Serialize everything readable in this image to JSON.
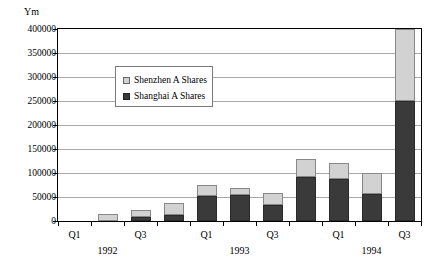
{
  "chart_data": {
    "type": "bar",
    "stacked": true,
    "title": "",
    "subtitle": "",
    "xlabel": "",
    "ylabel": "Ym",
    "ylim": [
      0,
      400000
    ],
    "ystep": 50000,
    "grid": true,
    "legend_position": "inside-top-left",
    "ytick_labels": [
      "400000",
      "350000",
      "300000",
      "250000",
      "200000",
      "150000",
      "100000",
      "50000",
      "0"
    ],
    "ytick_values": [
      400000,
      350000,
      300000,
      250000,
      200000,
      150000,
      100000,
      50000,
      0
    ],
    "categories": [
      "Q1 1992",
      "Q2 1992",
      "Q3 1992",
      "Q4 1992",
      "Q1 1993",
      "Q2 1993",
      "Q3 1993",
      "Q4 1993",
      "Q1 1994",
      "Q2 1994",
      "Q3 1994"
    ],
    "xtick_labels": [
      {
        "label": "Q1",
        "index": 0
      },
      {
        "label": "Q3",
        "index": 2
      },
      {
        "label": "Q1",
        "index": 4
      },
      {
        "label": "Q3",
        "index": 6
      },
      {
        "label": "Q1",
        "index": 8
      },
      {
        "label": "Q3",
        "index": 10
      }
    ],
    "year_labels": [
      {
        "label": "1992",
        "index": 1
      },
      {
        "label": "1993",
        "index": 5
      },
      {
        "label": "1994",
        "index": 9
      }
    ],
    "series": [
      {
        "name": "Shanghai A Shares",
        "color": "#3a3a3a",
        "values": [
          0,
          1000,
          8000,
          13000,
          52000,
          55000,
          33000,
          92000,
          88000,
          57000,
          250000
        ]
      },
      {
        "name": "Shenzhen A Shares",
        "color": "#d2d2d2",
        "values": [
          0,
          14000,
          15000,
          25000,
          23000,
          13000,
          25000,
          38000,
          32000,
          43000,
          150000
        ]
      }
    ]
  },
  "legend": {
    "entries": [
      {
        "label": "Shenzhen A Shares",
        "swatch": "light"
      },
      {
        "label": "Shanghai A Shares",
        "swatch": "dark"
      }
    ]
  }
}
